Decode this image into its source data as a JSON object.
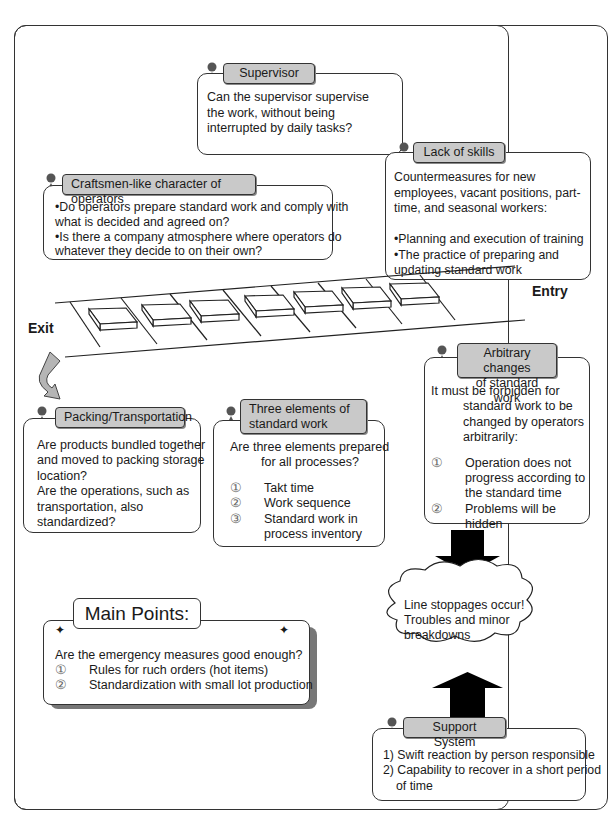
{
  "diagram": {
    "title_caption_visible": "",
    "supervisor": {
      "tag": "Supervisor",
      "lines": [
        "Can the supervisor supervise",
        "the work, without being",
        "interrupted by daily tasks?"
      ]
    },
    "lack_of_skills": {
      "tag": "Lack of skills",
      "lines": [
        "Countermeasures for new",
        "employees, vacant positions, part-",
        "time, and seasonal workers:",
        "",
        "•Planning and execution of training",
        "•The practice of preparing and",
        "updating standard work"
      ]
    },
    "craftsmen": {
      "tag": "Craftsmen-like character of operators",
      "lines": [
        "•Do operators prepare standard work and comply with",
        "what is decided and agreed on?",
        "•Is there a company atmosphere where operators do",
        "whatever they decide to on their own?"
      ]
    },
    "conveyor": {
      "entry_label": "Entry",
      "exit_label": "Exit",
      "item_count": 7
    },
    "packing": {
      "tag": "Packing/Transportation",
      "lines": [
        "Are products bundled together",
        "and moved to packing storage",
        "location?",
        "Are the operations, such as",
        "transportation, also",
        "standardized?"
      ]
    },
    "three_elements": {
      "tag_line1": "Three elements of",
      "tag_line2": "standard work",
      "intro1": "Are three elements prepared",
      "intro2": "for all processes?",
      "items": [
        {
          "num": "①",
          "text": "Takt time"
        },
        {
          "num": "②",
          "text": "Work sequence"
        },
        {
          "num": "③",
          "text": "Standard work in"
        },
        {
          "num": "",
          "text": "process inventory"
        }
      ]
    },
    "arbitrary": {
      "tag_line1": "Arbitrary changes",
      "tag_line2": "of standard work",
      "intro": [
        "It must be forbidden for",
        "standard work to be",
        "changed by operators",
        "arbitrarily:"
      ],
      "items": [
        {
          "num": "①",
          "text": "Operation does not"
        },
        {
          "num": "",
          "text": "progress according to"
        },
        {
          "num": "",
          "text": "the standard time"
        },
        {
          "num": "②",
          "text": "Problems will be"
        },
        {
          "num": "",
          "text": "hidden"
        }
      ]
    },
    "cloud": {
      "lines": [
        "Line stoppages occur!",
        "Troubles and minor",
        "breakdowns"
      ]
    },
    "main_points": {
      "title": "Main Points:",
      "question": "Are the emergency measures good enough?",
      "items": [
        {
          "num": "①",
          "text": "Rules for ruch orders (hot items)"
        },
        {
          "num": "②",
          "text": "Standardization with small lot production"
        }
      ]
    },
    "support": {
      "tag": "Support System",
      "lines": [
        "1) Swift reaction by person responsible",
        "2) Capability to recover in a short period",
        "of time"
      ]
    },
    "colors": {
      "tag_fill": "#c9c9c9",
      "border": "#333333",
      "arrow": "#000000",
      "curved_arrow": "#b5b5b5"
    }
  }
}
